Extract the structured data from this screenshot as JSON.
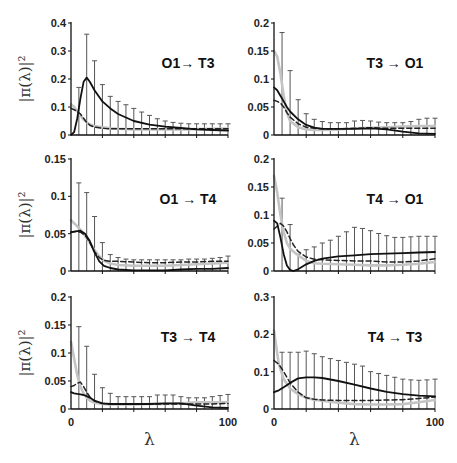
{
  "chart_data": {
    "type": "line",
    "layout": "3x2 grid of panels",
    "ylabel": "|π(λ)|²",
    "xlabel": "λ",
    "x_ticks": [
      0,
      100
    ],
    "grid": false,
    "legend": null,
    "series_styles": {
      "solid": {
        "color": "#111111",
        "dash": "",
        "width": 1.8
      },
      "dashed": {
        "color": "#222222",
        "dash": "5,3",
        "width": 1.5
      },
      "gray": {
        "color": "#c4c4c4",
        "dash": "",
        "width": 2.6
      }
    },
    "errorbar_x": [
      5,
      10,
      15,
      20,
      25,
      30,
      35,
      40,
      45,
      50,
      55,
      60,
      65,
      70,
      75,
      80,
      85,
      90,
      95,
      100
    ],
    "panels": [
      {
        "id": "O1-T3",
        "title": "O1→ T3",
        "row": 0,
        "col": 0,
        "ylim": [
          0,
          0.4
        ],
        "yticks": [
          0,
          0.1,
          0.2,
          0.3,
          0.4
        ],
        "ytick_labels": [
          "0",
          "0.1",
          "0.2",
          "0.3",
          "0.4"
        ],
        "show_ylabel": true,
        "show_xticklabels": false,
        "x": [
          0,
          2,
          4,
          6,
          8,
          10,
          12,
          15,
          20,
          25,
          30,
          40,
          50,
          60,
          70,
          80,
          90,
          100
        ],
        "series": [
          {
            "name": "solid",
            "values": [
              0,
              0.01,
              0.06,
              0.13,
              0.19,
              0.205,
              0.19,
              0.16,
              0.12,
              0.095,
              0.075,
              0.05,
              0.037,
              0.03,
              0.025,
              0.02,
              0.018,
              0.016
            ]
          },
          {
            "name": "dashed",
            "values": [
              0.095,
              0.09,
              0.085,
              0.075,
              0.06,
              0.045,
              0.035,
              0.028,
              0.024,
              0.022,
              0.022,
              0.022,
              0.022,
              0.022,
              0.022,
              0.022,
              0.022,
              0.022
            ]
          },
          {
            "name": "gray",
            "values": [
              0.11,
              0.1,
              0.085,
              0.07,
              0.055,
              0.045,
              0.038,
              0.032,
              0.027,
              0.024,
              0.022,
              0.02,
              0.02,
              0.02,
              0.02,
              0.021,
              0.022,
              0.023
            ]
          }
        ],
        "errorbar_top": [
          0.17,
          0.36,
          0.265,
          0.18,
          0.138,
          0.12,
          0.108,
          0.095,
          0.082,
          0.07,
          0.058,
          0.05,
          0.045,
          0.042,
          0.04,
          0.04,
          0.04,
          0.04,
          0.04,
          0.04
        ]
      },
      {
        "id": "T3-O1",
        "title": "T3 → O1",
        "row": 0,
        "col": 1,
        "ylim": [
          0,
          0.2
        ],
        "yticks": [
          0,
          0.05,
          0.1,
          0.15,
          0.2
        ],
        "ytick_labels": [
          "0",
          "0.05",
          "0.1",
          "0.15",
          "0.2"
        ],
        "show_ylabel": false,
        "show_xticklabels": false,
        "x": [
          0,
          2,
          4,
          6,
          8,
          10,
          15,
          20,
          25,
          30,
          40,
          50,
          60,
          70,
          80,
          90,
          100
        ],
        "series": [
          {
            "name": "solid",
            "values": [
              0.085,
              0.08,
              0.07,
              0.06,
              0.05,
              0.042,
              0.028,
              0.018,
              0.013,
              0.011,
              0.011,
              0.011,
              0.012,
              0.01,
              0.006,
              0.003,
              0.002
            ]
          },
          {
            "name": "dashed",
            "values": [
              0.062,
              0.06,
              0.057,
              0.05,
              0.04,
              0.032,
              0.02,
              0.014,
              0.012,
              0.011,
              0.011,
              0.012,
              0.013,
              0.012,
              0.012,
              0.012,
              0.012
            ]
          },
          {
            "name": "gray",
            "values": [
              0.15,
              0.14,
              0.11,
              0.07,
              0.04,
              0.025,
              0.014,
              0.01,
              0.009,
              0.009,
              0.01,
              0.012,
              0.013,
              0.014,
              0.015,
              0.016,
              0.016
            ]
          }
        ],
        "errorbar_top": [
          0.183,
          0.115,
          0.063,
          0.038,
          0.028,
          0.024,
          0.022,
          0.022,
          0.022,
          0.025,
          0.026,
          0.025,
          0.023,
          0.022,
          0.022,
          0.022,
          0.024,
          0.028,
          0.03,
          0.03
        ]
      },
      {
        "id": "O1-T4",
        "title": "O1 → T4",
        "row": 1,
        "col": 0,
        "ylim": [
          0,
          0.15
        ],
        "yticks": [
          0,
          0.05,
          0.1,
          0.15
        ],
        "ytick_labels": [
          "0",
          "0.05",
          "0.1",
          "0.15"
        ],
        "show_ylabel": true,
        "show_xticklabels": false,
        "x": [
          0,
          3,
          6,
          9,
          12,
          15,
          18,
          21,
          25,
          30,
          40,
          50,
          60,
          70,
          80,
          90,
          100
        ],
        "series": [
          {
            "name": "solid",
            "values": [
              0.052,
              0.053,
              0.054,
              0.05,
              0.04,
              0.025,
              0.013,
              0.007,
              0.004,
              0.002,
              0.001,
              0.001,
              0.001,
              0.002,
              0.003,
              0.003,
              0.004
            ]
          },
          {
            "name": "dashed",
            "values": [
              0.052,
              0.053,
              0.052,
              0.048,
              0.038,
              0.026,
              0.018,
              0.014,
              0.013,
              0.013,
              0.012,
              0.011,
              0.011,
              0.012,
              0.012,
              0.013,
              0.013
            ]
          },
          {
            "name": "gray",
            "values": [
              0.068,
              0.062,
              0.055,
              0.047,
              0.038,
              0.028,
              0.02,
              0.014,
              0.01,
              0.008,
              0.007,
              0.007,
              0.007,
              0.008,
              0.009,
              0.01,
              0.011
            ]
          }
        ],
        "errorbar_top": [
          0.118,
          0.105,
          0.073,
          0.038,
          0.022,
          0.018,
          0.016,
          0.015,
          0.015,
          0.015,
          0.015,
          0.015,
          0.015,
          0.015,
          0.016,
          0.016,
          0.016,
          0.017,
          0.018,
          0.02
        ]
      },
      {
        "id": "T4-O1",
        "title": "T4 → O1",
        "row": 1,
        "col": 1,
        "ylim": [
          0,
          0.2
        ],
        "yticks": [
          0,
          0.05,
          0.1,
          0.15,
          0.2
        ],
        "ytick_labels": [
          "0",
          "0.05",
          "0.1",
          "0.15",
          "0.2"
        ],
        "show_ylabel": false,
        "show_xticklabels": false,
        "x": [
          0,
          2,
          4,
          6,
          8,
          10,
          12,
          15,
          20,
          25,
          30,
          40,
          50,
          60,
          70,
          80,
          90,
          100
        ],
        "series": [
          {
            "name": "solid",
            "values": [
              0.09,
              0.085,
              0.06,
              0.03,
              0.01,
              0.002,
              0.0,
              0.003,
              0.012,
              0.018,
              0.022,
              0.026,
              0.028,
              0.03,
              0.031,
              0.032,
              0.033,
              0.034
            ]
          },
          {
            "name": "dashed",
            "values": [
              0.075,
              0.08,
              0.085,
              0.08,
              0.07,
              0.058,
              0.047,
              0.035,
              0.025,
              0.021,
              0.02,
              0.019,
              0.018,
              0.018,
              0.016,
              0.016,
              0.018,
              0.022
            ]
          },
          {
            "name": "gray",
            "values": [
              0.17,
              0.14,
              0.1,
              0.07,
              0.05,
              0.04,
              0.035,
              0.028,
              0.018,
              0.014,
              0.013,
              0.012,
              0.011,
              0.01,
              0.01,
              0.011,
              0.013,
              0.016
            ]
          }
        ],
        "errorbar_top": [
          0.13,
          0.083,
          0.03,
          0.038,
          0.043,
          0.05,
          0.055,
          0.062,
          0.07,
          0.078,
          0.076,
          0.072,
          0.067,
          0.063,
          0.06,
          0.06,
          0.061,
          0.062,
          0.062,
          0.062
        ]
      },
      {
        "id": "T3-T4",
        "title": "T3 → T4",
        "row": 2,
        "col": 0,
        "ylim": [
          0,
          0.2
        ],
        "yticks": [
          0,
          0.05,
          0.1,
          0.15,
          0.2
        ],
        "ytick_labels": [
          "0",
          "0.05",
          "0.1",
          "0.15",
          "0.2"
        ],
        "show_ylabel": true,
        "show_xticklabels": true,
        "x": [
          0,
          2,
          4,
          6,
          8,
          10,
          12,
          15,
          20,
          25,
          30,
          40,
          50,
          60,
          70,
          80,
          90,
          100
        ],
        "series": [
          {
            "name": "solid",
            "values": [
              0.03,
              0.028,
              0.027,
              0.026,
              0.025,
              0.023,
              0.02,
              0.015,
              0.01,
              0.009,
              0.009,
              0.009,
              0.009,
              0.01,
              0.01,
              0.006,
              0.003,
              0.002
            ]
          },
          {
            "name": "dashed",
            "values": [
              0.04,
              0.042,
              0.046,
              0.048,
              0.04,
              0.03,
              0.022,
              0.014,
              0.01,
              0.009,
              0.009,
              0.009,
              0.009,
              0.009,
              0.009,
              0.009,
              0.009,
              0.01
            ]
          },
          {
            "name": "gray",
            "values": [
              0.12,
              0.09,
              0.06,
              0.04,
              0.028,
              0.02,
              0.015,
              0.011,
              0.009,
              0.008,
              0.008,
              0.008,
              0.009,
              0.009,
              0.01,
              0.012,
              0.012,
              0.012
            ]
          }
        ],
        "errorbar_top": [
          0.147,
          0.112,
          0.062,
          0.038,
          0.028,
          0.022,
          0.022,
          0.022,
          0.022,
          0.022,
          0.025,
          0.025,
          0.025,
          0.022,
          0.02,
          0.02,
          0.02,
          0.022,
          0.024,
          0.026
        ]
      },
      {
        "id": "T4-T3",
        "title": "T4 → T3",
        "row": 2,
        "col": 1,
        "ylim": [
          0,
          0.3
        ],
        "yticks": [
          0,
          0.1,
          0.2,
          0.3
        ],
        "ytick_labels": [
          "0",
          "0.1",
          "0.2",
          "0.3"
        ],
        "show_ylabel": false,
        "show_xticklabels": true,
        "x": [
          0,
          3,
          6,
          10,
          15,
          20,
          25,
          30,
          40,
          50,
          60,
          70,
          80,
          90,
          100
        ],
        "series": [
          {
            "name": "solid",
            "values": [
              0.045,
              0.05,
              0.058,
              0.07,
              0.082,
              0.085,
              0.085,
              0.083,
              0.075,
              0.065,
              0.055,
              0.046,
              0.04,
              0.036,
              0.034
            ]
          },
          {
            "name": "dashed",
            "values": [
              0.13,
              0.12,
              0.1,
              0.07,
              0.045,
              0.03,
              0.026,
              0.024,
              0.023,
              0.023,
              0.023,
              0.024,
              0.025,
              0.028,
              0.032
            ]
          },
          {
            "name": "gray",
            "values": [
              0.21,
              0.12,
              0.08,
              0.055,
              0.04,
              0.03,
              0.025,
              0.022,
              0.017,
              0.013,
              0.012,
              0.012,
              0.013,
              0.018,
              0.024
            ]
          }
        ],
        "errorbar_top": [
          0.152,
          0.152,
          0.152,
          0.155,
          0.148,
          0.14,
          0.135,
          0.13,
          0.125,
          0.12,
          0.115,
          0.1,
          0.095,
          0.09,
          0.085,
          0.08,
          0.078,
          0.077,
          0.078,
          0.08
        ]
      }
    ]
  }
}
